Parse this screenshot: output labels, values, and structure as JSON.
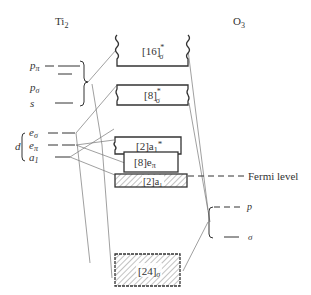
{
  "diagram": {
    "left_title": "Ti",
    "left_title_sub": "2",
    "right_title": "O",
    "right_title_sub": "3",
    "ti_levels": [
      {
        "id": "p-pi",
        "main": "p",
        "sub": "π"
      },
      {
        "id": "p-sigma",
        "main": "p",
        "sub": "σ"
      },
      {
        "id": "s",
        "main": "s",
        "sub": ""
      },
      {
        "id": "e-sigma",
        "main": "e",
        "sub": "σ"
      },
      {
        "id": "e-pi",
        "main": "e",
        "sub": "π"
      },
      {
        "id": "a1",
        "main": "a",
        "sub": "1"
      }
    ],
    "d_group_label": "d",
    "bands": [
      {
        "id": "band-16-sigma-star",
        "text": "[16]",
        "sub": "σ",
        "sup": "*"
      },
      {
        "id": "band-8-sigma-star",
        "text": "[8]",
        "sub": "σ",
        "sup": "*"
      },
      {
        "id": "band-2a1-star",
        "text": "[2]a",
        "sub": "1",
        "sup": "*"
      },
      {
        "id": "band-8e-pi",
        "text": "[8]e",
        "sub": "π",
        "sup": ""
      },
      {
        "id": "band-2a1",
        "text": "[2]a",
        "sub": "1",
        "sup": ""
      },
      {
        "id": "band-24-sigma",
        "text": "[24]",
        "sub": "σ",
        "sup": ""
      }
    ],
    "fermi_label": "Fermi level",
    "o_levels": [
      {
        "id": "o-p",
        "label": "p"
      },
      {
        "id": "o-sigma",
        "label": "σ"
      }
    ],
    "colors": {
      "line": "#333333",
      "connector": "#777777",
      "hatch": "#666666"
    }
  }
}
